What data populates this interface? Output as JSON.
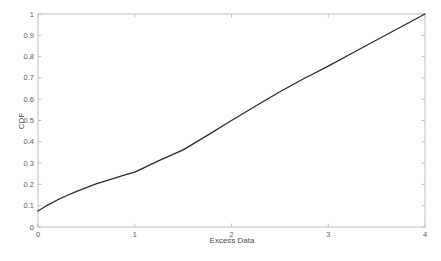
{
  "figure": {
    "background": "#ffffff"
  },
  "colors": {
    "line": "#2b2b2b",
    "axis_box": "#c2c2c2",
    "tick_mark": "#c2c2c2",
    "tick_label": "#606060",
    "axis_title": "#4d4d4d"
  },
  "chart_data": {
    "type": "line",
    "title": "",
    "xlabel": "Excess Data",
    "ylabel": "CDF",
    "xlim": [
      0,
      4
    ],
    "ylim": [
      0,
      1
    ],
    "xticks": [
      0,
      1,
      2,
      3,
      4
    ],
    "xtick_labels": [
      "0",
      "1",
      "2",
      "3",
      "4"
    ],
    "yticks": [
      0,
      0.1,
      0.2,
      0.3,
      0.4,
      0.5,
      0.6,
      0.7,
      0.8,
      0.9,
      1
    ],
    "ytick_labels": [
      "0",
      "0.1",
      "0.2",
      "0.3",
      "0.4",
      "0.5",
      "0.6",
      "0.7",
      "0.8",
      "0.9",
      "1"
    ],
    "grid": false,
    "legend": "none",
    "box": true,
    "tick_direction": "in",
    "series": [
      {
        "name": "CDF",
        "x": [
          0,
          0.1,
          0.2,
          0.3,
          0.4,
          0.5,
          0.6,
          0.7,
          0.8,
          0.9,
          1.0,
          1.25,
          1.5,
          1.75,
          2.0,
          2.25,
          2.5,
          2.75,
          3.0,
          3.25,
          3.5,
          3.75,
          4.0
        ],
        "y": [
          0.075,
          0.103,
          0.127,
          0.148,
          0.167,
          0.185,
          0.202,
          0.217,
          0.231,
          0.245,
          0.258,
          0.312,
          0.362,
          0.43,
          0.5,
          0.568,
          0.635,
          0.697,
          0.755,
          0.817,
          0.878,
          0.939,
          1.0
        ]
      }
    ]
  }
}
